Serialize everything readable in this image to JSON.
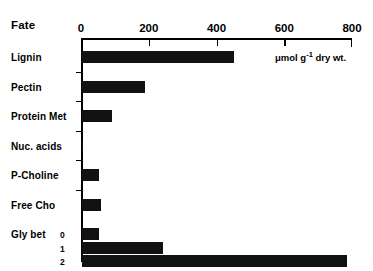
{
  "figure": {
    "title": "Fate",
    "units_prefix": "μmol g",
    "units_sup": "-1",
    "units_suffix": " dry wt."
  },
  "chart_data": {
    "type": "bar",
    "orientation": "horizontal",
    "title": "Fate",
    "xlabel": "μmol g-1 dry wt.",
    "ylabel": "",
    "xlim": [
      0,
      800
    ],
    "xticks": [
      0,
      200,
      400,
      600,
      800
    ],
    "xtick_labels": [
      "0",
      "200",
      "400",
      "600",
      "800"
    ],
    "grid": false,
    "legend": false,
    "bar_color": "#111111",
    "categories": [
      "Lignin",
      "Pectin",
      "Protein Met",
      "Nuc. acids",
      "P-Choline",
      "Free Cho",
      "Gly bet"
    ],
    "values": [
      448,
      186,
      88,
      3,
      50,
      56,
      null
    ],
    "bars": [
      {
        "label": "Lignin",
        "sub": "",
        "value": 448
      },
      {
        "label": "Pectin",
        "sub": "",
        "value": 186
      },
      {
        "label": "Protein Met",
        "sub": "",
        "value": 88
      },
      {
        "label": "Nuc. acids",
        "sub": "",
        "value": 3
      },
      {
        "label": "P-Choline",
        "sub": "",
        "value": 50
      },
      {
        "label": "Free Cho",
        "sub": "",
        "value": 56
      },
      {
        "label": "Gly bet",
        "sub": "0",
        "value": 50
      },
      {
        "label": "",
        "sub": "1",
        "value": 239
      },
      {
        "label": "",
        "sub": "2",
        "value": 782
      }
    ],
    "sub_labels": [
      "0",
      "1",
      "2"
    ]
  }
}
